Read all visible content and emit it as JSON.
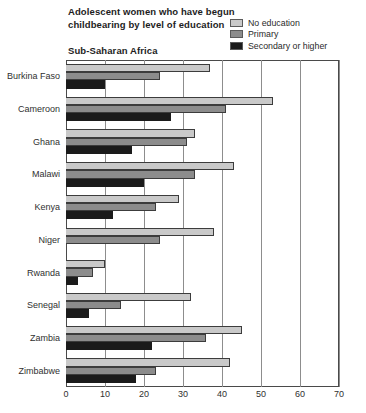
{
  "title": {
    "line1": "Adolescent women who have begun",
    "line2": "childbearing by level of education"
  },
  "region": "Sub-Saharan Africa",
  "legend": {
    "items": [
      {
        "label": "No education",
        "color": "#c9c9c9",
        "icon": "legend-swatch-icon"
      },
      {
        "label": "Primary",
        "color": "#8c8c8c",
        "icon": "legend-swatch-icon"
      },
      {
        "label": "Secondary or higher",
        "color": "#1b1b1b",
        "icon": "legend-swatch-icon"
      }
    ]
  },
  "chart_data": {
    "type": "bar",
    "orientation": "horizontal",
    "title": "Adolescent women who have begun childbearing by level of education",
    "subtitle": "Sub-Saharan Africa",
    "xlabel": "",
    "ylabel": "",
    "xlim": [
      0,
      70
    ],
    "xticks": [
      0,
      10,
      20,
      30,
      40,
      50,
      60,
      70
    ],
    "grid": true,
    "legend_position": "top-right",
    "categories": [
      "Burkina Faso",
      "Cameroon",
      "Ghana",
      "Malawi",
      "Kenya",
      "Niger",
      "Rwanda",
      "Senegal",
      "Zambia",
      "Zimbabwe"
    ],
    "series": [
      {
        "name": "No education",
        "color": "#c9c9c9",
        "values": [
          37,
          53,
          33,
          43,
          29,
          38,
          10,
          32,
          45,
          42
        ]
      },
      {
        "name": "Primary",
        "color": "#8c8c8c",
        "values": [
          24,
          41,
          31,
          33,
          23,
          24,
          7,
          14,
          36,
          23
        ]
      },
      {
        "name": "Secondary or higher",
        "color": "#1b1b1b",
        "values": [
          10,
          27,
          17,
          20,
          12,
          0,
          3,
          6,
          22,
          18
        ]
      }
    ]
  }
}
